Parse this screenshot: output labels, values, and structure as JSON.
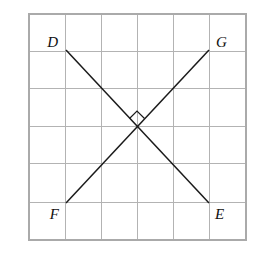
{
  "figure": {
    "type": "geometry-diagram",
    "canvas": {
      "width": 272,
      "height": 277,
      "background": "#ffffff"
    },
    "grid": {
      "columns": 6,
      "rows": 6,
      "x_left": 29,
      "x_right": 246,
      "y_top": 14,
      "y_bottom": 240,
      "cell_width": 36.2,
      "cell_height": 37.7,
      "line_color": "#b3b3b3",
      "border_color": "#aaaaaa"
    },
    "points": {
      "D": {
        "label": "D",
        "x": 66,
        "y": 50,
        "label_x": 58,
        "label_y": 47,
        "anchor": "end"
      },
      "G": {
        "label": "G",
        "x": 209,
        "y": 50,
        "label_x": 216,
        "label_y": 47,
        "anchor": "start"
      },
      "F": {
        "label": "F",
        "x": 66,
        "y": 203,
        "label_x": 59,
        "label_y": 219,
        "anchor": "end"
      },
      "E": {
        "label": "E",
        "x": 209,
        "y": 203,
        "label_x": 215,
        "label_y": 219,
        "anchor": "start"
      }
    },
    "segments": [
      {
        "name": "DE",
        "from": "D",
        "to": "E",
        "x1": 66,
        "y1": 50,
        "x2": 209,
        "y2": 203,
        "color": "#1a1a1a"
      },
      {
        "name": "FG",
        "from": "F",
        "to": "G",
        "x1": 66,
        "y1": 203,
        "x2": 209,
        "y2": 50,
        "color": "#1a1a1a"
      }
    ],
    "intersection": {
      "x": 137,
      "y": 126,
      "angle": "90",
      "marker": "right-angle-square"
    },
    "angle_marker_path": "M 129 118 L 137 110 L 145 118",
    "labels_order": [
      "D",
      "G",
      "F",
      "E"
    ]
  }
}
